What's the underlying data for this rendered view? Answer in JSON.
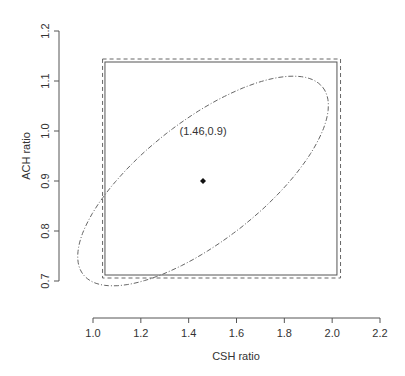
{
  "chart_data": {
    "type": "scatter",
    "title": "",
    "xlabel": "CSH ratio",
    "ylabel": "ACH ratio",
    "xlim": [
      1.0,
      2.2
    ],
    "ylim": [
      0.7,
      1.2
    ],
    "x_ticks": [
      1.0,
      1.2,
      1.4,
      1.6,
      1.8,
      2.0,
      2.2
    ],
    "x_tick_labels": [
      "1.0",
      "1.2",
      "1.4",
      "1.6",
      "1.8",
      "2.0",
      "2.2"
    ],
    "y_ticks": [
      0.7,
      0.8,
      0.9,
      1.0,
      1.1,
      1.2
    ],
    "y_tick_labels": [
      "0.7",
      "0.8",
      "0.9",
      "1.0",
      "1.1",
      "1.2"
    ],
    "grid": false,
    "point": {
      "x": 1.46,
      "y": 0.9
    },
    "annotation": {
      "text": "(1.46,0.9)",
      "x": 1.46,
      "y": 1.0
    },
    "inner_rectangle": {
      "x0": 1.05,
      "x1": 2.02,
      "y0": 0.712,
      "y1": 1.138,
      "style": "solid"
    },
    "outer_rectangle": {
      "x0": 1.04,
      "x1": 2.035,
      "y0": 0.706,
      "y1": 1.144,
      "style": "dashed"
    },
    "ellipse": {
      "cx": 1.46,
      "cy": 0.9,
      "style": "dotdash",
      "points": [
        [
          1.02,
          0.706
        ],
        [
          1.12,
          0.684
        ],
        [
          1.3,
          0.716
        ],
        [
          1.52,
          0.796
        ],
        [
          1.74,
          0.906
        ],
        [
          1.93,
          1.026
        ],
        [
          2.04,
          1.116
        ],
        [
          2.02,
          1.158
        ],
        [
          1.9,
          1.156
        ],
        [
          1.7,
          1.1
        ],
        [
          1.48,
          1.01
        ],
        [
          1.26,
          0.888
        ],
        [
          1.09,
          0.78
        ]
      ]
    }
  }
}
